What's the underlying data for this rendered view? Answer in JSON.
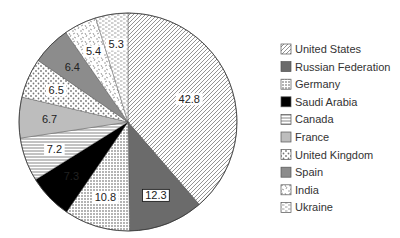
{
  "chart_data": {
    "type": "pie",
    "title": "",
    "start_angle_deg": 0,
    "direction": "clockwise",
    "total": 110.7,
    "categories": [
      "United States",
      "Russian Federation",
      "Germany",
      "Saudi Arabia",
      "Canada",
      "France",
      "United Kingdom",
      "Spain",
      "India",
      "Ukraine"
    ],
    "values": [
      42.8,
      12.3,
      10.8,
      7.3,
      7.2,
      6.7,
      6.5,
      6.4,
      5.4,
      5.3
    ],
    "labels": [
      "42.8",
      "12.3",
      "10.8",
      "7.3",
      "7.2",
      "6.7",
      "6.5",
      "6.4",
      "5.4",
      "5.3"
    ],
    "fills": [
      "diag-hatch",
      "#6b6b6b",
      "dense-dots",
      "#000000",
      "horiz-lines",
      "#bdbdbd",
      "sparse-dots",
      "#8c8c8c",
      "confetti",
      "dashes"
    ],
    "legend": {
      "position": "right",
      "entries": [
        "United States",
        "Russian Federation",
        "Germany",
        "Saudi Arabia",
        "Canada",
        "France",
        "United Kingdom",
        "Spain",
        "India",
        "Ukraine"
      ]
    }
  }
}
